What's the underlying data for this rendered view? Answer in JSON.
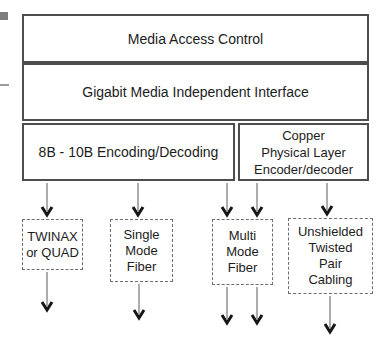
{
  "boxes": {
    "mac": {
      "label": "Media Access Control"
    },
    "gmii": {
      "label": "Gigabit Media Independent Interface"
    },
    "encoding": {
      "label": "8B - 10B Encoding/Decoding"
    },
    "copper": {
      "lines": [
        "Copper",
        "Physical Layer",
        "Encoder/decoder"
      ]
    }
  },
  "media_boxes": {
    "twinax": {
      "lines": [
        "TWINAX",
        "or QUAD"
      ]
    },
    "single_mode": {
      "lines": [
        "Single",
        "Mode",
        "Fiber"
      ]
    },
    "multi_mode": {
      "lines": [
        "Multi",
        "Mode",
        "Fiber"
      ]
    },
    "utp": {
      "lines": [
        "Unshielded",
        "Twisted",
        "Pair",
        "Cabling"
      ]
    }
  },
  "colors": {
    "box_border": "#4d4d4d",
    "dashed_border": "#6e6e6e",
    "text": "#1c1c1c",
    "arrow_head": "#161616",
    "arrow_stem": "#8a8a8a",
    "edge_mark": "#7d7d7d"
  }
}
